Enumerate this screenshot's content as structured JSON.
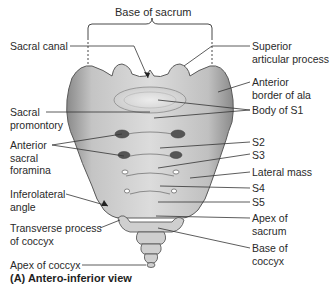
{
  "diagram": {
    "title": "Base of sacrum",
    "caption": "(A) Antero-inferior view",
    "labels_left": [
      {
        "id": "sacral-canal",
        "lines": [
          "Sacral canal"
        ]
      },
      {
        "id": "sacral-promontory",
        "lines": [
          "Sacral",
          "promontory"
        ]
      },
      {
        "id": "anterior-sacral-foramina",
        "lines": [
          "Anterior",
          "sacral",
          "foramina"
        ]
      },
      {
        "id": "inferolateral-angle",
        "lines": [
          "Inferolateral",
          "angle"
        ]
      },
      {
        "id": "transverse-process-of-coccyx",
        "lines": [
          "Transverse process",
          "of coccyx"
        ]
      },
      {
        "id": "apex-of-coccyx",
        "lines": [
          "Apex of coccyx"
        ]
      }
    ],
    "labels_right": [
      {
        "id": "superior-articular-process",
        "lines": [
          "Superior",
          "articular process"
        ]
      },
      {
        "id": "anterior-border-of-ala",
        "lines": [
          "Anterior",
          "border of ala"
        ]
      },
      {
        "id": "body-of-s1",
        "lines": [
          "Body of S1"
        ]
      },
      {
        "id": "s2",
        "lines": [
          "S2"
        ]
      },
      {
        "id": "s3",
        "lines": [
          "S3"
        ]
      },
      {
        "id": "lateral-mass",
        "lines": [
          "Lateral mass"
        ]
      },
      {
        "id": "s4",
        "lines": [
          "S4"
        ]
      },
      {
        "id": "s5",
        "lines": [
          "S5"
        ]
      },
      {
        "id": "apex-of-sacrum",
        "lines": [
          "Apex of",
          "sacrum"
        ]
      },
      {
        "id": "base-of-coccyx",
        "lines": [
          "Base of",
          "coccyx"
        ]
      }
    ],
    "colors": {
      "bone_light": "#e4e4e4",
      "bone_mid": "#b8b8b8",
      "bone_dark": "#7a7a7a",
      "outline": "#555555",
      "leader": "#333333"
    }
  }
}
